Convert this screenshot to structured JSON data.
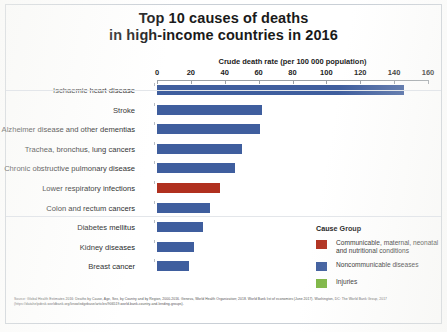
{
  "title": {
    "line1": "Top 10 causes of deaths",
    "line2": "in high-income countries in 2016"
  },
  "legend": {
    "heading": "Cause Group",
    "items": [
      {
        "label": "Communicable, maternal, neonatal and nutritional conditions",
        "color": "#B0301F"
      },
      {
        "label": "Noncommunicable diseases",
        "color": "#3F5E9E"
      },
      {
        "label": "Injuries",
        "color": "#7CB542"
      }
    ]
  },
  "source": "Source: Global Health Estimates 2016: Deaths by Cause, Age, Sex, by Country and by Region, 2000-2016. Geneva, World Health Organization; 2018. World Bank list of economies (June 2017). Washington, DC: The World Bank Group, 2017 (https://datahelpdesk.worldbank.org/knowledgebase/articles/906519-world-bank-country-and-lending-groups).",
  "chart_data": {
    "type": "bar",
    "orientation": "horizontal",
    "title": "Top 10 causes of deaths in high-income countries in 2016",
    "xlabel": "Crude death rate (per 100 000 population)",
    "ylabel": "",
    "xlim": [
      0,
      160
    ],
    "xticks": [
      0,
      20,
      40,
      60,
      80,
      100,
      120,
      140,
      160
    ],
    "grid": false,
    "legend_position": "right",
    "categories": [
      "Ischaemic heart disease",
      "Stroke",
      "Alzheimer disease and other dementias",
      "Trachea, bronchus, lung cancers",
      "Chronic obstructive pulmonary disease",
      "Lower respiratory infections",
      "Colon and rectum cancers",
      "Diabetes mellitus",
      "Kidney diseases",
      "Breast cancer"
    ],
    "values": [
      146,
      62,
      61,
      50,
      46,
      37,
      31,
      27,
      22,
      19
    ],
    "groups": [
      "Noncommunicable diseases",
      "Noncommunicable diseases",
      "Noncommunicable diseases",
      "Noncommunicable diseases",
      "Noncommunicable diseases",
      "Communicable, maternal, neonatal and nutritional conditions",
      "Noncommunicable diseases",
      "Noncommunicable diseases",
      "Noncommunicable diseases",
      "Noncommunicable diseases"
    ],
    "colors": [
      "#3F5E9E",
      "#3F5E9E",
      "#3F5E9E",
      "#3F5E9E",
      "#3F5E9E",
      "#B0301F",
      "#3F5E9E",
      "#3F5E9E",
      "#3F5E9E",
      "#3F5E9E"
    ]
  }
}
